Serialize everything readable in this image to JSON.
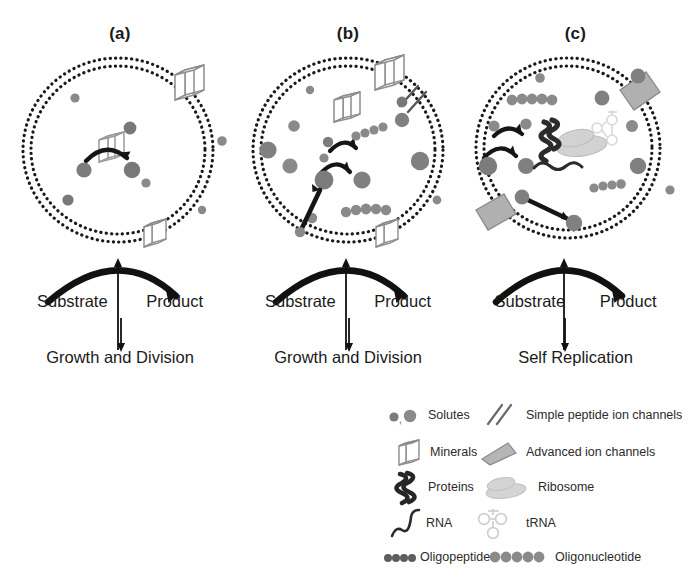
{
  "figure": {
    "type": "schematic-diagram",
    "panels": [
      {
        "id": "a",
        "label": "(a)",
        "flow_left_label": "Substrate",
        "flow_right_label": "Product",
        "outcome_label": "Growth and Division",
        "contents": [
          "mineral-catalyst",
          "solutes",
          "dotted-bilayer-membrane",
          "membrane-embedded-mineral"
        ]
      },
      {
        "id": "b",
        "label": "(b)",
        "flow_left_label": "Substrate",
        "flow_right_label": "Product",
        "outcome_label": "Growth and Division",
        "contents": [
          "minerals",
          "solutes",
          "oligopeptides",
          "oligonucleotides",
          "simple-peptide-ion-channel",
          "reaction-network"
        ]
      },
      {
        "id": "c",
        "label": "(c)",
        "flow_left_label": "Substrate",
        "flow_right_label": "Product",
        "outcome_label": "Self Replication",
        "contents": [
          "protein-helix",
          "ribosome",
          "tRNA",
          "RNA",
          "oligopeptides",
          "oligonucleotides",
          "advanced-ion-channels",
          "solutes",
          "reaction-network"
        ]
      }
    ]
  },
  "legend": {
    "items": [
      {
        "icon": "solutes-icon",
        "label": "Solutes"
      },
      {
        "icon": "simple-peptide-channel-icon",
        "label": "Simple peptide ion channels"
      },
      {
        "icon": "minerals-icon",
        "label": "Minerals"
      },
      {
        "icon": "advanced-channel-icon",
        "label": "Advanced ion channels"
      },
      {
        "icon": "proteins-icon",
        "label": "Proteins"
      },
      {
        "icon": "ribosome-icon",
        "label": "Ribosome"
      },
      {
        "icon": "rna-icon",
        "label": "RNA"
      },
      {
        "icon": "trna-icon",
        "label": "tRNA"
      },
      {
        "icon": "oligopeptide-icon",
        "label": "Oligopeptide"
      },
      {
        "icon": "oligonucleotide-icon",
        "label": "Oligonucleotide"
      }
    ]
  },
  "colors": {
    "background": "#ffffff",
    "ink": "#1a1a1a",
    "solute_dark": "#6e6e6e",
    "solute_mid": "#8a8a8a",
    "mineral_outline": "#8d8d8d",
    "channel_grey": "#a8a8a8",
    "ribosome_grey": "#cfcfcf",
    "protein_dark": "#2a2a2a"
  }
}
